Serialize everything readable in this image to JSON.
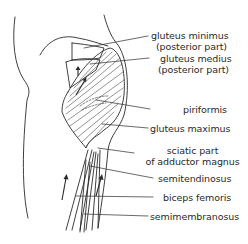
{
  "figure": {
    "type": "anatomical line drawing",
    "colors": {
      "ink": "#2a2a2a",
      "background": "#ffffff"
    }
  },
  "labels": [
    {
      "id": "gluteus-minimus",
      "lines": [
        "gluteus minimus",
        "(posterior part)"
      ]
    },
    {
      "id": "gluteus-medius",
      "lines": [
        "gluteus medius",
        "(posterior part)"
      ]
    },
    {
      "id": "piriformis",
      "lines": [
        "piriformis"
      ]
    },
    {
      "id": "gluteus-maximus",
      "lines": [
        "gluteus maximus"
      ]
    },
    {
      "id": "adductor-magnus",
      "lines": [
        "sciatic part",
        "of adductor magnus"
      ]
    },
    {
      "id": "semitendinosus",
      "lines": [
        "semitendinosus"
      ]
    },
    {
      "id": "biceps-femoris",
      "lines": [
        "biceps femoris"
      ]
    },
    {
      "id": "semimembranosus",
      "lines": [
        "semimembranosus"
      ]
    }
  ],
  "arrows": [
    {
      "name": "upward-arrow-gluteus-medius"
    },
    {
      "name": "diagonal-arrow-gluteus-maximus"
    },
    {
      "name": "upward-arrow-left-thigh"
    },
    {
      "name": "upward-arrow-right-thigh"
    }
  ]
}
